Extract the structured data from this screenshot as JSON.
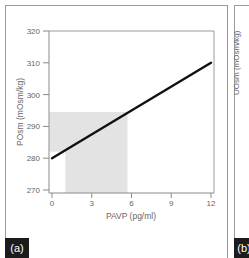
{
  "chart_data": {
    "type": "line",
    "panel_label": "(a)",
    "title": "",
    "xlabel": "PAVP (pg/ml)",
    "ylabel": "POsm (mOsm/kg)",
    "xlim": [
      0,
      12
    ],
    "ylim": [
      270,
      320
    ],
    "xticks": [
      0,
      3,
      6,
      9,
      12
    ],
    "yticks": [
      270,
      280,
      290,
      300,
      310,
      320
    ],
    "grid": false,
    "legend": null,
    "series": [
      {
        "name": "POsm vs PAVP",
        "x": [
          0,
          12
        ],
        "y": [
          280,
          310
        ],
        "color": "#111111"
      }
    ],
    "shaded_region": {
      "description": "grey normal range region",
      "color": "#e3e3e3",
      "polygon": [
        [
          0,
          282
        ],
        [
          0,
          294.5
        ],
        [
          5.7,
          294.5
        ],
        [
          5.7,
          270
        ],
        [
          1,
          270
        ],
        [
          1,
          282
        ]
      ]
    }
  },
  "panels": {
    "a": {
      "label": "(a)"
    },
    "b": {
      "label": "(b)",
      "ylabel": "UOsm (mOsm/kg)"
    }
  },
  "axes": {
    "x_ticks": [
      "0",
      "3",
      "6",
      "9",
      "12"
    ],
    "y_ticks": [
      "320",
      "310",
      "300",
      "290",
      "280",
      "270"
    ],
    "x_title": "PAVP (pg/ml)",
    "y_title": "POsm (mOsm/kg)"
  }
}
